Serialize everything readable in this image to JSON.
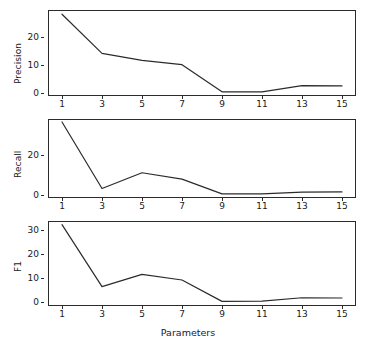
{
  "chart_data": [
    {
      "type": "line",
      "title": "",
      "xlabel": "",
      "ylabel": "Precision",
      "x": [
        1,
        3,
        5,
        7,
        9,
        11,
        13,
        15
      ],
      "values": [
        28.0,
        14.0,
        11.5,
        10.0,
        0.3,
        0.3,
        2.5,
        2.4
      ],
      "xticks": [
        1,
        3,
        5,
        7,
        9,
        11,
        13,
        15
      ],
      "xticklabels": [
        "1",
        "3",
        "5",
        "7",
        "9",
        "11",
        "13",
        "15"
      ],
      "yticks": [
        0,
        10,
        20
      ],
      "yticklabels": [
        "0",
        "10",
        "20"
      ],
      "xlim": [
        0.3,
        15.7
      ],
      "ylim": [
        -1.2,
        29.5
      ],
      "grid": false,
      "legend": false,
      "line_color": "#2b2b2b"
    },
    {
      "type": "line",
      "title": "",
      "xlabel": "",
      "ylabel": "Recall",
      "x": [
        1,
        3,
        5,
        7,
        9,
        11,
        13,
        15
      ],
      "values": [
        37.0,
        3.2,
        11.2,
        8.0,
        0.5,
        0.5,
        1.4,
        1.5
      ],
      "xticks": [
        1,
        3,
        5,
        7,
        9,
        11,
        13,
        15
      ],
      "xticklabels": [
        "1",
        "3",
        "5",
        "7",
        "9",
        "11",
        "13",
        "15"
      ],
      "yticks": [
        0,
        20
      ],
      "yticklabels": [
        "0",
        "20"
      ],
      "xlim": [
        0.3,
        15.7
      ],
      "ylim": [
        -1.6,
        38.5
      ],
      "grid": false,
      "legend": false,
      "line_color": "#2b2b2b"
    },
    {
      "type": "line",
      "title": "",
      "xlabel": "Parameters",
      "ylabel": "F1",
      "x": [
        1,
        3,
        5,
        7,
        9,
        11,
        13,
        15
      ],
      "values": [
        32.0,
        6.5,
        11.5,
        9.2,
        0.4,
        0.5,
        1.9,
        1.8
      ],
      "xticks": [
        1,
        3,
        5,
        7,
        9,
        11,
        13,
        15
      ],
      "xticklabels": [
        "1",
        "3",
        "5",
        "7",
        "9",
        "11",
        "13",
        "15"
      ],
      "yticks": [
        0,
        10,
        20,
        30
      ],
      "yticklabels": [
        "0",
        "10",
        "20",
        "30"
      ],
      "xlim": [
        0.3,
        15.7
      ],
      "ylim": [
        -1.5,
        33.5
      ],
      "grid": false,
      "legend": false,
      "line_color": "#2b2b2b"
    }
  ],
  "figure": {
    "background": "#ffffff",
    "axis_color": "#2b2b2b",
    "text_color": "#1a1a1a",
    "xlabel": "Parameters"
  }
}
